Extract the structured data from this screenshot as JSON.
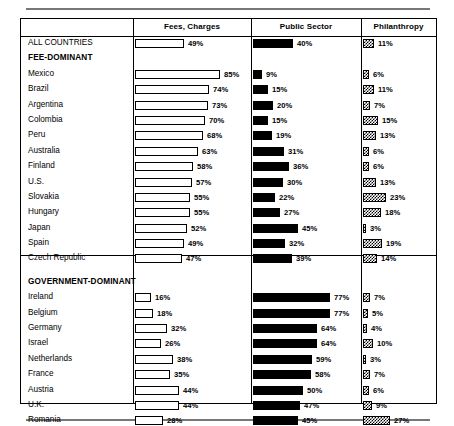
{
  "document": {
    "type": "scanned-table-figure",
    "columns": [
      {
        "key": "fees",
        "label": "Fees, Charges"
      },
      {
        "key": "public",
        "label": "Public Sector"
      },
      {
        "key": "phil",
        "label": "Philanthropy"
      }
    ]
  },
  "chart_data": {
    "type": "bar",
    "title": "",
    "xlabel": "",
    "ylabel": "",
    "xlim": [
      0,
      100
    ],
    "grid": false,
    "legend_position": "column-headers",
    "unit": "%",
    "series": [
      {
        "name": "Fees, Charges",
        "style": "open-outline"
      },
      {
        "name": "Public Sector",
        "style": "solid-black"
      },
      {
        "name": "Philanthropy",
        "style": "checkerboard"
      }
    ],
    "categories": [
      "ALL COUNTRIES",
      "Mexico",
      "Brazil",
      "Argentina",
      "Colombia",
      "Peru",
      "Australia",
      "Finland",
      "U.S.",
      "Slovakia",
      "Hungary",
      "Japan",
      "Spain",
      "Czech Republic",
      "Ireland",
      "Belgium",
      "Germany",
      "Israel",
      "Netherlands",
      "France",
      "Austria",
      "U.K.",
      "Romania"
    ],
    "values": {
      "fees": [
        49,
        85,
        74,
        73,
        70,
        68,
        63,
        58,
        57,
        55,
        55,
        52,
        49,
        47,
        16,
        18,
        32,
        26,
        38,
        35,
        44,
        44,
        28
      ],
      "public": [
        40,
        9,
        15,
        20,
        15,
        19,
        31,
        36,
        30,
        22,
        27,
        45,
        32,
        39,
        77,
        77,
        64,
        64,
        59,
        58,
        50,
        47,
        45
      ],
      "phil": [
        11,
        6,
        11,
        7,
        15,
        13,
        6,
        6,
        13,
        23,
        18,
        3,
        19,
        14,
        7,
        5,
        4,
        10,
        3,
        7,
        6,
        9,
        27
      ]
    }
  },
  "rows": [
    {
      "type": "data",
      "label": "ALL COUNTRIES",
      "bold": true,
      "fees": "49%",
      "fees_v": 49,
      "public": "40%",
      "public_v": 40,
      "phil": "11%",
      "phil_v": 11
    },
    {
      "type": "group",
      "label": "FEE-DOMINANT",
      "bold": true
    },
    {
      "type": "data",
      "label": "Mexico",
      "fees": "85%",
      "fees_v": 85,
      "public": "9%",
      "public_v": 9,
      "phil": "6%",
      "phil_v": 6
    },
    {
      "type": "data",
      "label": "Brazil",
      "fees": "74%",
      "fees_v": 74,
      "public": "15%",
      "public_v": 15,
      "phil": "11%",
      "phil_v": 11
    },
    {
      "type": "data",
      "label": "Argentina",
      "fees": "73%",
      "fees_v": 73,
      "public": "20%",
      "public_v": 20,
      "phil": "7%",
      "phil_v": 7
    },
    {
      "type": "data",
      "label": "Colombia",
      "fees": "70%",
      "fees_v": 70,
      "public": "15%",
      "public_v": 15,
      "phil": "15%",
      "phil_v": 15
    },
    {
      "type": "data",
      "label": "Peru",
      "fees": "68%",
      "fees_v": 68,
      "public": "19%",
      "public_v": 19,
      "phil": "13%",
      "phil_v": 13
    },
    {
      "type": "data",
      "label": "Australia",
      "fees": "63%",
      "fees_v": 63,
      "public": "31%",
      "public_v": 31,
      "phil": "6%",
      "phil_v": 6
    },
    {
      "type": "data",
      "label": "Finland",
      "fees": "58%",
      "fees_v": 58,
      "public": "36%",
      "public_v": 36,
      "phil": "6%",
      "phil_v": 6
    },
    {
      "type": "data",
      "label": "U.S.",
      "fees": "57%",
      "fees_v": 57,
      "public": "30%",
      "public_v": 30,
      "phil": "13%",
      "phil_v": 13
    },
    {
      "type": "data",
      "label": "Slovakia",
      "fees": "55%",
      "fees_v": 55,
      "public": "22%",
      "public_v": 22,
      "phil": "23%",
      "phil_v": 23
    },
    {
      "type": "data",
      "label": "Hungary",
      "fees": "55%",
      "fees_v": 55,
      "public": "27%",
      "public_v": 27,
      "phil": "18%",
      "phil_v": 18
    },
    {
      "type": "data",
      "label": "Japan",
      "fees": "52%",
      "fees_v": 52,
      "public": "45%",
      "public_v": 45,
      "phil": "3%",
      "phil_v": 3
    },
    {
      "type": "data",
      "label": "Spain",
      "fees": "49%",
      "fees_v": 49,
      "public": "32%",
      "public_v": 32,
      "phil": "19%",
      "phil_v": 19
    },
    {
      "type": "data",
      "label": "Czech Republic",
      "fees": "47%",
      "fees_v": 47,
      "public": "39%",
      "public_v": 39,
      "phil": "14%",
      "phil_v": 14
    },
    {
      "type": "gap"
    },
    {
      "type": "group",
      "label": "GOVERNMENT-DOMINANT",
      "bold": true
    },
    {
      "type": "data",
      "label": "Ireland",
      "fees": "16%",
      "fees_v": 16,
      "public": "77%",
      "public_v": 77,
      "phil": "7%",
      "phil_v": 7
    },
    {
      "type": "data",
      "label": "Belgium",
      "fees": "18%",
      "fees_v": 18,
      "public": "77%",
      "public_v": 77,
      "phil": "5%",
      "phil_v": 5
    },
    {
      "type": "data",
      "label": "Germany",
      "fees": "32%",
      "fees_v": 32,
      "public": "64%",
      "public_v": 64,
      "phil": "4%",
      "phil_v": 4
    },
    {
      "type": "data",
      "label": "Israel",
      "fees": "26%",
      "fees_v": 26,
      "public": "64%",
      "public_v": 64,
      "phil": "10%",
      "phil_v": 10
    },
    {
      "type": "data",
      "label": "Netherlands",
      "fees": "38%",
      "fees_v": 38,
      "public": "59%",
      "public_v": 59,
      "phil": "3%",
      "phil_v": 3
    },
    {
      "type": "data",
      "label": "France",
      "fees": "35%",
      "fees_v": 35,
      "public": "58%",
      "public_v": 58,
      "phil": "7%",
      "phil_v": 7
    },
    {
      "type": "data",
      "label": "Austria",
      "fees": "44%",
      "fees_v": 44,
      "public": "50%",
      "public_v": 50,
      "phil": "6%",
      "phil_v": 6
    },
    {
      "type": "data",
      "label": "U.K.",
      "fees": "44%",
      "fees_v": 44,
      "public": "47%",
      "public_v": 47,
      "phil": "9%",
      "phil_v": 9
    },
    {
      "type": "data",
      "label": "Romania",
      "fees": "28%",
      "fees_v": 28,
      "public": "45%",
      "public_v": 45,
      "phil": "27%",
      "phil_v": 27
    }
  ]
}
